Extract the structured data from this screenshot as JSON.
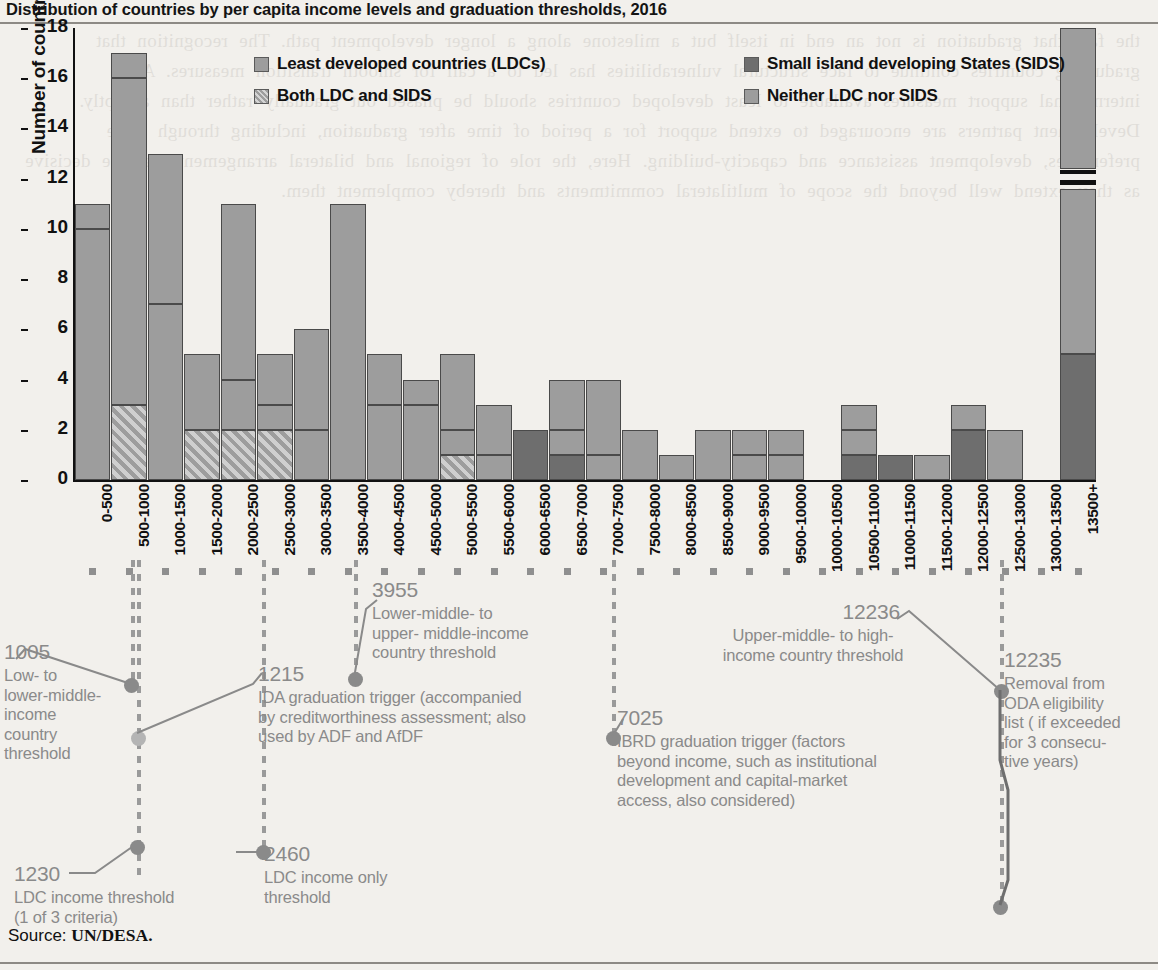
{
  "title": "Distribution of countries by per capita income levels and graduation thresholds, 2016",
  "source": {
    "label": "Source: ",
    "value": "UN/DESA."
  },
  "legend": {
    "items": [
      {
        "key": "ldc",
        "label": "Least developed countries (LDCs)"
      },
      {
        "key": "both",
        "label": "Both LDC and SIDS"
      },
      {
        "key": "sids",
        "label": "Small island developing States (SIDS)"
      },
      {
        "key": "neither",
        "label": "Neither LDC nor SIDS"
      }
    ]
  },
  "chart_data": {
    "type": "bar",
    "stacked": true,
    "title": "Distribution of countries by per capita income levels and graduation thresholds, 2016",
    "xlabel": "",
    "ylabel": "Number of countries",
    "ylim": [
      0,
      18
    ],
    "yticks": [
      0,
      2,
      4,
      6,
      8,
      10,
      12,
      14,
      16,
      18
    ],
    "grid": false,
    "legend_position": "top-inside",
    "axis_break": {
      "bar": "13500+",
      "from": 6,
      "to": 13
    },
    "categories": [
      "0-500",
      "500-1000",
      "1000-1500",
      "1500-2000",
      "2000-2500",
      "2500-3000",
      "3000-3500",
      "3500-4000",
      "4000-4500",
      "4500-5000",
      "5000-5500",
      "5500-6000",
      "6000-6500",
      "6500-7000",
      "7000-7500",
      "7500-8000",
      "8000-8500",
      "8500-9000",
      "9000-9500",
      "9500-10000",
      "10000-10500",
      "10500-11000",
      "11000-11500",
      "11500-12000",
      "12000-12500",
      "12500-13000",
      "13000-13500",
      "13500+"
    ],
    "series": [
      {
        "name": "Least developed countries (LDCs)",
        "key": "ldc",
        "values": [
          10,
          13,
          7,
          0,
          2,
          1,
          2,
          0,
          3,
          3,
          1,
          1,
          0,
          1,
          1,
          0,
          0,
          0,
          1,
          1,
          0,
          1,
          0,
          0,
          0,
          0,
          0,
          0
        ]
      },
      {
        "name": "Both LDC and SIDS",
        "key": "both",
        "values": [
          0,
          3,
          0,
          2,
          2,
          2,
          0,
          0,
          0,
          0,
          1,
          0,
          0,
          0,
          0,
          0,
          0,
          0,
          0,
          0,
          0,
          0,
          0,
          0,
          0,
          0,
          0,
          0
        ]
      },
      {
        "name": "Small island developing States (SIDS)",
        "key": "sids",
        "values": [
          0,
          0,
          0,
          0,
          0,
          0,
          0,
          0,
          0,
          0,
          0,
          0,
          2,
          1,
          0,
          0,
          0,
          0,
          0,
          0,
          0,
          1,
          1,
          0,
          2,
          0,
          0,
          5
        ]
      },
      {
        "name": "Neither LDC nor SIDS",
        "key": "neither",
        "values": [
          1,
          1,
          6,
          3,
          7,
          2,
          4,
          11,
          2,
          1,
          3,
          2,
          0,
          2,
          3,
          2,
          1,
          2,
          1,
          1,
          0,
          1,
          0,
          1,
          1,
          2,
          0,
          13
        ]
      }
    ],
    "totals": [
      11,
      17,
      13,
      5,
      11,
      5,
      6,
      11,
      5,
      4,
      5,
      3,
      2,
      4,
      4,
      2,
      1,
      2,
      2,
      2,
      0,
      3,
      1,
      1,
      3,
      2,
      0,
      18
    ],
    "annotations": [
      {
        "value": "1005",
        "text": "Low- to lower-middle-income country threshold",
        "lines": [
          "Low- to",
          "lower-middle-",
          "income",
          "country",
          "threshold"
        ]
      },
      {
        "value": "1230",
        "text": "LDC income threshold (1 of 3 criteria)",
        "lines": [
          "LDC income threshold",
          "(1 of 3 criteria)"
        ]
      },
      {
        "value": "1215",
        "text": "IDA graduation trigger (accompanied by creditworthiness assessment; also used by ADF and AfDF",
        "lines": [
          "IDA graduation trigger (accompanied",
          "by creditworthiness assessment; also",
          "used by ADF and AfDF"
        ]
      },
      {
        "value": "2460",
        "text": "LDC income only threshold",
        "lines": [
          "LDC income only",
          "threshold"
        ]
      },
      {
        "value": "3955",
        "text": "Lower-middle- to upper- middle-income country threshold",
        "lines": [
          "Lower-middle- to",
          "upper- middle-income",
          "country threshold"
        ]
      },
      {
        "value": "7025",
        "text": "IBRD graduation trigger (factors beyond income, such as institutional development and capital-market access, also considered)",
        "lines": [
          "IBRD graduation trigger (factors",
          "beyond income, such as institutional",
          "development and capital-market",
          "access, also considered)"
        ]
      },
      {
        "value": "12236",
        "text": "Upper-middle- to high-income country threshold",
        "lines": [
          "Upper-middle- to high-",
          "income country threshold"
        ]
      },
      {
        "value": "12235",
        "text": "Removal from ODA eligibility list ( if exceeded for 3 consecutive years)",
        "lines": [
          "Removal from",
          "ODA eligibility",
          "list ( if exceeded",
          "for 3 consecu-",
          "tive years)"
        ]
      }
    ]
  },
  "colors": {
    "ldc": "#9d9d9d",
    "sids": "#6e6e6e",
    "neither": "#9d9d9d",
    "callout_text": "#8a8a8a",
    "axis": "#111111",
    "page_bg": "#f2f0ec"
  },
  "bleed_text": "the fact that graduation is not an end in itself but a milestone along a longer development path. The recognition that graduating countries continue to face structural vulnerabilities has led to a call for smooth transition measures. All international support measures available to least developed countries should be phased out gradually rather than abruptly. Development partners are encouraged to extend support for a period of time after graduation, including through trade preferences, development assistance and capacity-building. Here, the role of regional and bilateral arrangements can be decisive as they extend well beyond the scope of multilateral commitments and thereby complement them."
}
